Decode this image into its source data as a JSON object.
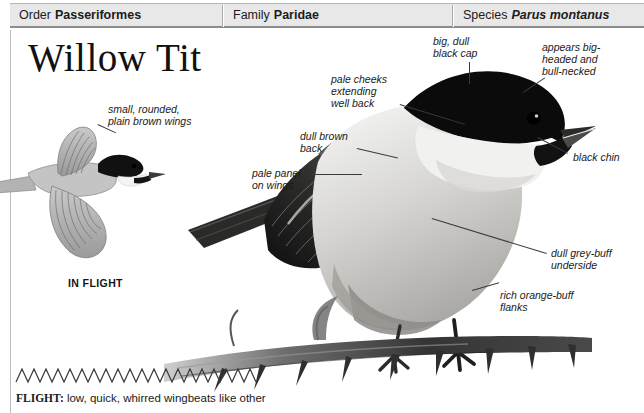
{
  "header": {
    "order": {
      "label": "Order",
      "value": "Passeriformes"
    },
    "family": {
      "label": "Family",
      "value": "Paridae"
    },
    "species": {
      "label": "Species",
      "value": "Parus montanus"
    }
  },
  "title": "Willow Tit",
  "flight_illustration": {
    "caption": "IN FLIGHT",
    "annotation": "small, rounded,\nplain brown wings"
  },
  "annotations": {
    "black_cap": "big, dull\nblack cap",
    "big_headed": "appears big-\nheaded and\nbull-necked",
    "pale_cheeks": "pale cheeks\nextending\nwell back",
    "dull_brown_back": "dull brown\nback",
    "pale_panel": "pale panel\non wings",
    "black_chin": "black chin",
    "grey_buff_underside": "dull grey-buff\nunderside",
    "orange_buff_flanks": "rich orange-buff\nflanks"
  },
  "flight_note": {
    "keyword": "FLIGHT:",
    "text": " low, quick, whirred wingbeats like other"
  },
  "colors": {
    "header_background": "#e8e8e8",
    "rule": "#8c8c8c",
    "text": "#1a1a1a",
    "cap_black": "#0d0d0d",
    "body_grey": "#8f8f8f",
    "pale_cheek": "#f2f2f0",
    "branch_dark": "#3a3a3a"
  }
}
